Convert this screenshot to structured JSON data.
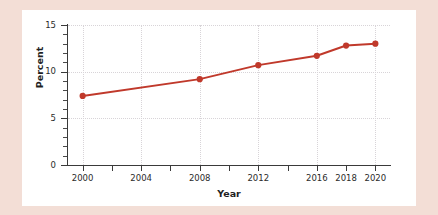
{
  "figure": {
    "background_color": "#f3ded6",
    "card_color": "#ffffff"
  },
  "chart_data": {
    "type": "line",
    "title": "",
    "subtitle": "",
    "xlabel": "Year",
    "ylabel": "Percent",
    "x": [
      2000,
      2008,
      2012,
      2016,
      2018,
      2020
    ],
    "values": [
      7.4,
      9.2,
      10.7,
      11.7,
      12.8,
      13.0
    ],
    "series": [
      {
        "name": "Percent",
        "color": "#c0392b",
        "marker": "circle",
        "values": [
          7.4,
          9.2,
          10.7,
          11.7,
          12.8,
          13.0
        ]
      }
    ],
    "xlim": [
      1999,
      2021
    ],
    "ylim": [
      0,
      15
    ],
    "x_tick_labels": [
      "2000",
      "2004",
      "2008",
      "2012",
      "2016",
      "2018",
      "2020"
    ],
    "x_tick_values": [
      2000,
      2004,
      2008,
      2012,
      2016,
      2018,
      2020
    ],
    "x_minor_tick_values": [
      2000,
      2002,
      2004,
      2006,
      2008,
      2010,
      2012,
      2014,
      2016,
      2018,
      2020
    ],
    "x_gridline_values": [
      2000,
      2004,
      2008,
      2012,
      2016,
      2020
    ],
    "y_tick_labels": [
      "0",
      "5",
      "10",
      "15"
    ],
    "y_tick_values": [
      0,
      5,
      10,
      15
    ],
    "y_minor_tick_values": [
      1,
      2,
      3,
      4,
      6,
      7,
      8,
      9,
      11,
      12,
      13,
      14
    ],
    "y_gridline_values": [
      5,
      10,
      15
    ],
    "grid": true,
    "grid_style": "dotted",
    "grid_color": "#d8d4d8",
    "legend": "none",
    "axis_color": "#3a3a3a",
    "line_color": "#c0392b",
    "marker_color": "#c0392b"
  }
}
